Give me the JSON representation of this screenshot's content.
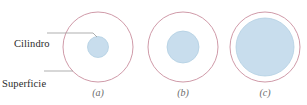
{
  "figure": {
    "annotations": [
      {
        "id": "cilindro",
        "text": "Cilindro"
      },
      {
        "id": "superficie",
        "line1": "Superficie",
        "line2": "gaussiana"
      }
    ],
    "captions": [
      {
        "id": "a",
        "text": "(a)"
      },
      {
        "id": "b",
        "text": "(b)"
      },
      {
        "id": "c",
        "text": "(c)"
      }
    ],
    "colors": {
      "gaussian_surface_stroke": "#c98f9e",
      "cylinder_fill": "#c8dded",
      "cylinder_stroke": "#b3cfe2",
      "leader_line": "#8c8c8c",
      "label_text": "#2b2b2b",
      "caption_text": "#6a6a6a",
      "background": "#ffffff"
    },
    "panels": [
      {
        "id": "a",
        "center_x": 98,
        "center_y": 47,
        "gaussian_radius": 35,
        "cylinder_radius": 10.5
      },
      {
        "id": "b",
        "center_x": 183,
        "center_y": 47,
        "gaussian_radius": 35,
        "cylinder_radius": 16
      },
      {
        "id": "c",
        "center_x": 265,
        "center_y": 47,
        "gaussian_radius": 35,
        "cylinder_radius": 29
      }
    ],
    "leaders": [
      {
        "id": "cilindro-leader",
        "x1": 47,
        "y1": 33,
        "x2": 95,
        "y2": 33,
        "x3": 97,
        "y3": 37
      },
      {
        "id": "superficie-leader",
        "x1": 44,
        "y1": 71,
        "x2": 72,
        "y2": 71
      }
    ]
  }
}
